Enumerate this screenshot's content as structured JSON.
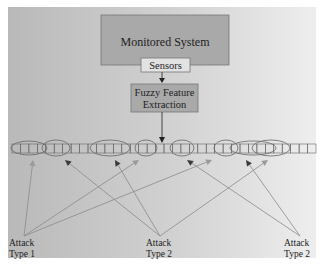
{
  "diagram": {
    "nodes": {
      "monitored_system": {
        "label": "Monitored System"
      },
      "sensors": {
        "label": "Sensors"
      },
      "feature_extraction": {
        "label_line1": "Fuzzy Feature",
        "label_line2": "Extraction"
      }
    },
    "stream": {
      "cell_count": 36
    },
    "attack_labels": [
      {
        "line1": "Attack",
        "line2": "Type 1"
      },
      {
        "line1": "Attack",
        "line2": "Type 2"
      },
      {
        "line1": "Attack",
        "line2": "Type 2"
      }
    ],
    "colors": {
      "box_fill": "#a9a9a9",
      "sensor_fill": "#e2e2e2",
      "light_arrow": "#9a9a9a",
      "dark_arrow": "#3a3a3a"
    }
  }
}
